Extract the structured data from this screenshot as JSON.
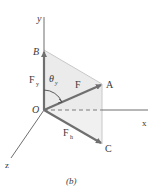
{
  "figure": {
    "caption": "(b)",
    "colors": {
      "axis": "#6e6e6e",
      "vector": "#6f6f6f",
      "vector_dark": "#5a5a5a",
      "plane_fill": "#e6e6e6",
      "plane_fill_light": "#f1f1f1",
      "plane_edge": "#c8c8c8",
      "text": "#3a3a3a"
    },
    "axes": {
      "x_label": "x",
      "y_label": "y",
      "z_label": "z"
    },
    "points": {
      "origin_label": "O",
      "A_label": "A",
      "B_label": "B",
      "C_label": "C"
    },
    "vectors": {
      "F_label": "F",
      "Fy_label_main": "F",
      "Fy_label_sub": "y",
      "Fh_label_main": "F",
      "Fh_label_sub": "h"
    },
    "angle": {
      "theta_main": "θ",
      "theta_sub": "y"
    }
  }
}
